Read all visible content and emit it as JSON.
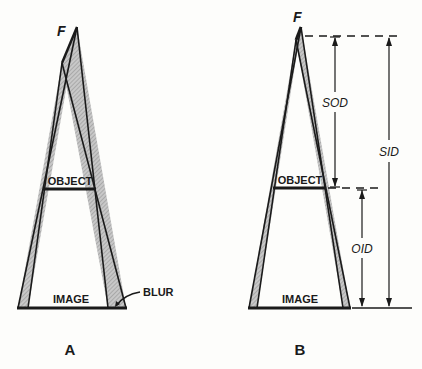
{
  "diagrams": [
    {
      "id": "A",
      "caption": "A",
      "focal_label": "F",
      "object_label": "OBJECT",
      "image_label": "IMAGE",
      "annotation": "BLUR"
    },
    {
      "id": "B",
      "caption": "B",
      "focal_label": "F",
      "object_label": "OBJECT",
      "image_label": "IMAGE",
      "dimensions": [
        {
          "label": "SOD"
        },
        {
          "label": "OID"
        },
        {
          "label": "SID"
        }
      ]
    }
  ],
  "colors": {
    "line": "#1a1a1a",
    "penumbra": "#b8b8b8",
    "background": "#fdfdfb"
  }
}
